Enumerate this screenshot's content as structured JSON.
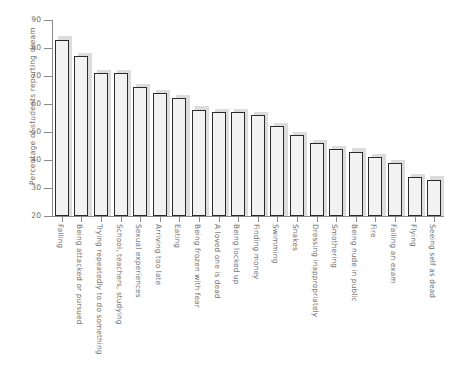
{
  "chart_data": {
    "type": "bar",
    "title": "",
    "xlabel": "",
    "ylabel": "Percentage of students reporting dream",
    "ylim": [
      20,
      90
    ],
    "yticks": [
      20,
      30,
      40,
      50,
      60,
      70,
      80,
      90
    ],
    "grid": false,
    "legend": null,
    "categories": [
      "Falling",
      "Being attacked or pursued",
      "Trying repeatedly to do something",
      "School, teachers, studying",
      "Sexual experiences",
      "Arriving too late",
      "Eating",
      "Being frozen with fear",
      "A loved one is dead",
      "Being locked up",
      "Finding money",
      "Swimming",
      "Snakes",
      "Dressing inappropriately",
      "Smothering",
      "Being nude in public",
      "Fire",
      "Failing an exam",
      "Flying",
      "Seeing self as dead"
    ],
    "values": [
      83,
      77,
      71,
      71,
      66,
      64,
      62,
      58,
      57,
      57,
      56,
      52,
      49,
      46,
      44,
      43,
      41,
      39,
      34,
      33
    ]
  },
  "style": {
    "bar_face": "#f2f2f2",
    "bar_edge": "#2b2b2b",
    "bar_shadow": "#d6d6d6",
    "axis_color": "#8a8a8a",
    "text_color": "#6e6e6e",
    "background": "#ffffff"
  }
}
